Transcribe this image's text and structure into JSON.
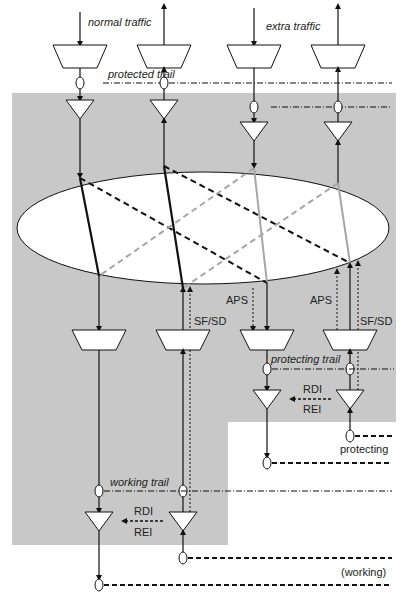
{
  "diagram": {
    "colors": {
      "background": "#ffffff",
      "domain_shade": "#c8c8c8",
      "line": "#111111",
      "gray_line": "#a6a6a6"
    },
    "labels": {
      "normal_traffic": "normal traffic",
      "extra_traffic": "extra traffic",
      "protected_trail": "protected trail",
      "protecting_trail": "protecting trail",
      "working_trail": "working trail",
      "aps_left": "APS",
      "aps_right": "APS",
      "sfsd_left": "SF/SD",
      "sfsd_right": "SF/SD",
      "rdi_protecting": "RDI",
      "rei_protecting": "REI",
      "rdi_working": "RDI",
      "rei_working": "REI",
      "protecting": "protecting",
      "working": "(working)"
    },
    "nodes": {
      "top_adapters": [
        "normal-tx",
        "normal-rx",
        "extra-tx",
        "extra-rx"
      ],
      "connection_matrix": "ellipse",
      "bottom_adapters": [
        "working-src",
        "working-snk",
        "protecting-src",
        "protecting-snk"
      ]
    }
  }
}
